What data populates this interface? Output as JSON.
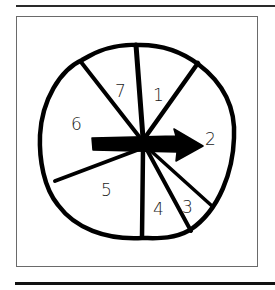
{
  "figure": {
    "type": "spinner",
    "colors": {
      "ink": "#000000",
      "frame": "#6a6a6a",
      "background": "#ffffff"
    },
    "sectors": [
      {
        "label": "1"
      },
      {
        "label": "2"
      },
      {
        "label": "3"
      },
      {
        "label": "4"
      },
      {
        "label": "5"
      },
      {
        "label": "6"
      },
      {
        "label": "7"
      }
    ],
    "pointer": "arrow-pointing-to-2"
  }
}
